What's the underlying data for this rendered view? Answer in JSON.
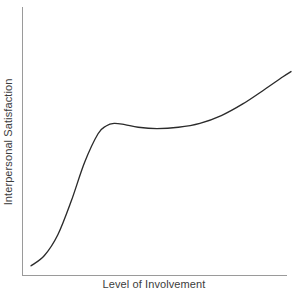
{
  "chart_data": {
    "type": "line",
    "title": "",
    "subtitle": "",
    "xlabel": "Level of Involvement",
    "ylabel": "Interpersonal Satisfaction",
    "grid": false,
    "legend": false,
    "legend_position": "none",
    "xlim": [
      0,
      100
    ],
    "ylim": [
      0,
      100
    ],
    "x_tick_labels": [],
    "y_tick_labels": [],
    "annotations": [],
    "series": [
      {
        "name": "Interpersonal Satisfaction",
        "color": "#2b2b2b",
        "x": [
          3,
          8,
          13,
          18,
          23,
          28,
          31,
          34,
          38,
          43,
          50,
          58,
          66,
          74,
          82,
          90,
          97,
          100
        ],
        "y": [
          2,
          6,
          14,
          27,
          42,
          53,
          56,
          57,
          56.5,
          55.5,
          55,
          55.5,
          57,
          60,
          64.5,
          70,
          75,
          77
        ]
      }
    ]
  },
  "axes": {
    "x_axis_color": "#9a9a9a",
    "y_axis_color": "#9a9a9a",
    "label_color": "#3c3c3c",
    "background_color": "#ffffff"
  }
}
